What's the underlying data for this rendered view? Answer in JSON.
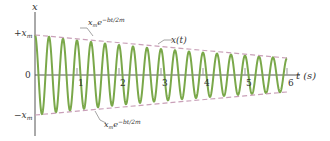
{
  "chart_data": {
    "type": "line",
    "title": "",
    "xlabel": "t (s)",
    "ylabel": "x",
    "x_ticks": [
      "1",
      "2",
      "3",
      "4",
      "5",
      "6"
    ],
    "y_ticks": [
      "+x_m",
      "0",
      "-x_m"
    ],
    "xlim": [
      0,
      6
    ],
    "ylim": [
      -1,
      1
    ],
    "grid": false,
    "series": [
      {
        "name": "x(t)",
        "description": "damped cosine oscillation x_m e^{-bt/2m} cos(ωt+φ)",
        "color": "#7aa84a",
        "cycles_per_second": 3,
        "amplitude_start": 1.0,
        "amplitude_end": 0.42
      },
      {
        "name": "x_m e^{-bt/2m}",
        "description": "upper envelope",
        "color": "#c9a0b8",
        "style": "dashed"
      },
      {
        "name": "-x_m e^{-bt/2m}",
        "description": "lower envelope",
        "color": "#c9a0b8",
        "style": "dashed"
      }
    ],
    "annotations": [
      {
        "text": "x_m e^{-bt/2m}",
        "target": "upper envelope"
      },
      {
        "text": "x(t)",
        "target": "oscillation curve"
      },
      {
        "text": "x_m e^{-bt/2m}",
        "target": "lower envelope"
      }
    ]
  },
  "labels": {
    "y_axis": "x",
    "x_axis": "t (s)",
    "plus_xm": "+x",
    "minus_xm": "−x",
    "m_sub": "m",
    "zero": "0",
    "curve": "x(t)",
    "env_base": "x",
    "env_sub": "m",
    "env_exp_upper": "−bt/2m",
    "env_exp_lower": "−bt/2m",
    "env_e": "e"
  },
  "ticks": [
    "1",
    "2",
    "3",
    "4",
    "5",
    "6"
  ]
}
